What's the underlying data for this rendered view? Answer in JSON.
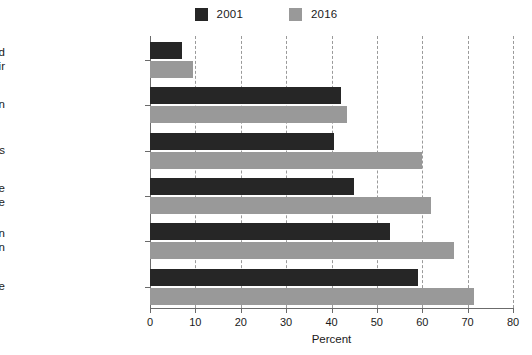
{
  "chart_data": {
    "type": "bar",
    "orientation": "horizontal",
    "title": "",
    "xlabel": "Percent",
    "ylabel": "",
    "xlim": [
      0,
      80
    ],
    "xticks": [
      0,
      10,
      20,
      30,
      40,
      50,
      60,
      70,
      80
    ],
    "grid": true,
    "legend_position": "top-center",
    "categories": [
      "Married men and women having an affair",
      "Abortion",
      "Gay or lesbian relations",
      "Having a baby outside of marriage",
      "Sex between an unmarried man and woman",
      "Divorce"
    ],
    "category_lines": [
      [
        "Married men and",
        "women having an affair"
      ],
      [
        "Abortion"
      ],
      [
        "Gay or lesbian relations"
      ],
      [
        "Having a baby outside",
        "of marriage"
      ],
      [
        "Sex between an",
        "unmarried man and woman"
      ],
      [
        "Divorce"
      ]
    ],
    "series": [
      {
        "name": "2001",
        "color": "#262626",
        "values": [
          7,
          42,
          40.5,
          45,
          53,
          59
        ]
      },
      {
        "name": "2016",
        "color": "#999999",
        "values": [
          9.5,
          43.5,
          60,
          62,
          67,
          71.5
        ]
      }
    ]
  },
  "legend": {
    "items": [
      {
        "label": "2001",
        "color": "#262626"
      },
      {
        "label": "2016",
        "color": "#999999"
      }
    ]
  },
  "axis": {
    "xlabel": "Percent",
    "tick_labels": [
      "0",
      "10",
      "20",
      "30",
      "40",
      "50",
      "60",
      "70",
      "80"
    ]
  }
}
